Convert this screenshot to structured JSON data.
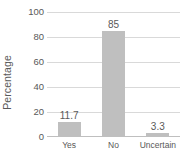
{
  "chart_data": {
    "type": "bar",
    "title": "",
    "subtitle": "",
    "xlabel": "",
    "ylabel": "Percentage",
    "categories": [
      "Yes",
      "No",
      "Uncertain"
    ],
    "values": [
      11.7,
      85,
      3.3
    ],
    "value_labels": [
      "11.7",
      "85",
      "3.3"
    ],
    "ylim": [
      0,
      100
    ],
    "y_ticks": [
      0,
      20,
      40,
      60,
      80,
      100
    ],
    "y_tick_labels": [
      "0",
      "20",
      "40",
      "60",
      "80",
      "100"
    ],
    "grid": true,
    "grid_axis": "y",
    "legend": false,
    "legend_position": "none",
    "annotations": [],
    "colors": {
      "bar_fill": "#bfbfbf",
      "gridline": "#d9d9d9",
      "baseline": "#bfbfbf",
      "text": "#595959",
      "background": "#ffffff"
    }
  }
}
